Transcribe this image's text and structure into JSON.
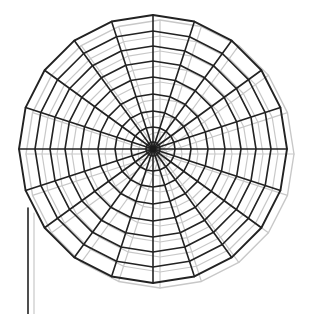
{
  "figure": {
    "canvas": {
      "width": 312,
      "height": 314,
      "background": "#ffffff"
    }
  },
  "chart_data": {
    "type": "scatter",
    "title": "Polar wireframe mesh of a parabolic dish antenna",
    "subtitle": "20-spoke radial grid with 9 concentric rings, drawn twice with a light offset ghost copy",
    "xlabel": "",
    "ylabel": "",
    "projection": "polar-mesh",
    "grid": true,
    "legend": false,
    "center": {
      "x": 153,
      "y": 149
    },
    "radius_px": 134,
    "spokes": 20,
    "spoke_angles_deg": [
      0,
      18,
      36,
      54,
      72,
      90,
      108,
      126,
      144,
      162,
      180,
      198,
      216,
      234,
      252,
      270,
      288,
      306,
      324,
      342
    ],
    "rings": 9,
    "ring_radii_px": [
      7,
      22,
      38,
      55,
      72,
      88,
      103,
      118,
      134
    ],
    "ring_radii_normalized": [
      0.05,
      0.16,
      0.28,
      0.41,
      0.54,
      0.66,
      0.77,
      0.88,
      1.0
    ],
    "series": [
      {
        "name": "dish-mesh-solid",
        "color": "#222222",
        "line_width": 1.6,
        "offset": {
          "dx": 0,
          "dy": 0
        }
      },
      {
        "name": "dish-mesh-ghost",
        "color": "#c8c8c8",
        "line_width": 1.2,
        "offset": {
          "dx": 7,
          "dy": 5
        }
      }
    ],
    "annotations": [
      {
        "name": "support-pole",
        "type": "line",
        "x": 28,
        "y_start": 208,
        "y_end": 314,
        "color": "#222222"
      },
      {
        "name": "support-pole-ghost",
        "type": "line",
        "x": 34,
        "y_start": 213,
        "y_end": 314,
        "color": "#c8c8c8"
      }
    ],
    "bounds": {
      "left_px": 22,
      "right_px": 292,
      "top_px": 13,
      "bottom_px": 287
    }
  },
  "colors": {
    "solid_stroke": "#222222",
    "ghost_stroke": "#c8c8c8",
    "hub_fill": "#1a1a1a",
    "background": "#ffffff"
  }
}
